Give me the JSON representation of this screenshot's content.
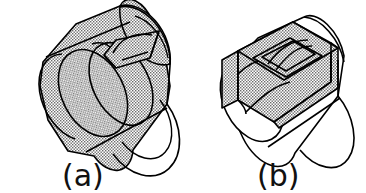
{
  "figure": {
    "kind": "technical-line-drawing",
    "projection": "isometric",
    "background_color": "#ffffff",
    "stroke_color": "#000000",
    "stipple_color": "#6e6e6e",
    "stipple_description": "fine checkerboard halftone dot fill",
    "panels": [
      {
        "id": "a",
        "caption": "(a)",
        "description": "Cylinder with shaded swept solid enclosing the full barrel and a rectangular pocket feature on the upper surface",
        "shaded": "entire-solid",
        "end_face_fill": "stipple"
      },
      {
        "id": "b",
        "caption": "(b)",
        "description": "Cylinder with a shaded rectangular slab block straddling the barrel and a rectangular pocket feature recessed into its top face",
        "shaded": "slab-block-only",
        "end_face_fill": "white"
      }
    ]
  },
  "captions": {
    "a": "(a)",
    "b": "(b)"
  }
}
